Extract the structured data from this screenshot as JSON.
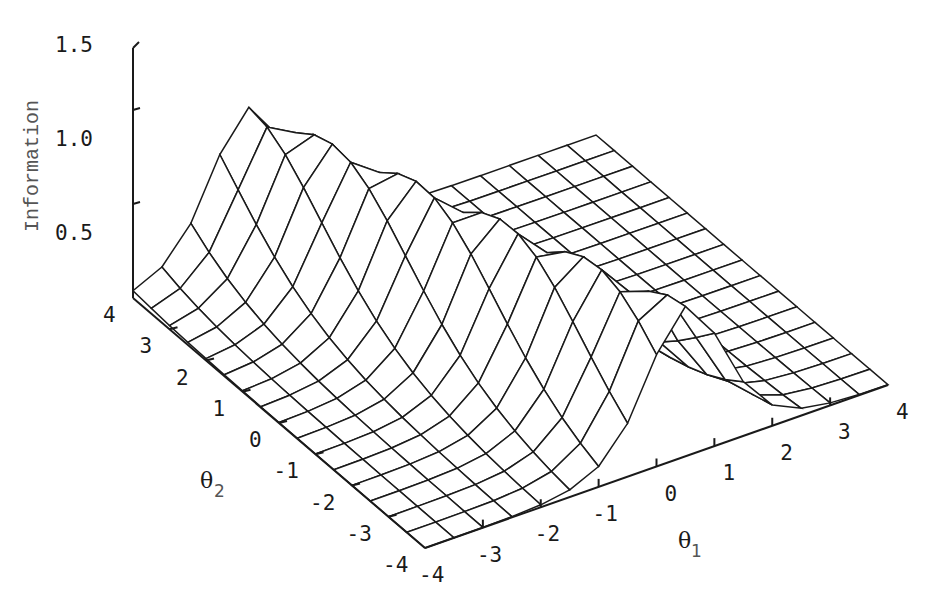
{
  "chart_data": {
    "type": "surface",
    "title": "",
    "zlabel": "Information",
    "xlabel": "θ1",
    "ylabel": "θ2",
    "x_symbol": "θ",
    "x_sub": "1",
    "y_symbol": "θ",
    "y_sub": "2",
    "x_ticks": [
      "-4",
      "-3",
      "-2",
      "-1",
      "0",
      "1",
      "2",
      "3",
      "4"
    ],
    "y_ticks": [
      "-4",
      "-3",
      "-2",
      "-1",
      "0",
      "1",
      "2",
      "3",
      "4"
    ],
    "z_ticks": [
      "0.5",
      "1.0",
      "1.5"
    ],
    "xlim": [
      -4,
      4
    ],
    "ylim": [
      -4,
      4
    ],
    "zlim": [
      0,
      1.5
    ],
    "grid_step": 0.5,
    "surface_model": {
      "description": "Ridge-shaped item information surface, I = a^2 * P * (1 - P), P = 1/(1+exp(-(a1*θ1 + a2*θ2 + d)))",
      "a1": 2.2,
      "a2": 0.69,
      "d": 1.65
    },
    "key_points": [
      {
        "theta1": -4,
        "theta2": 4,
        "information": 0.05
      },
      {
        "theta1": -2,
        "theta2": 4,
        "information": 1.33
      },
      {
        "theta1": 0.5,
        "theta2": -4,
        "information": 1.25
      },
      {
        "theta1": -4,
        "theta2": -4,
        "information": 0.0
      },
      {
        "theta1": 4,
        "theta2": -4,
        "information": 0.03
      },
      {
        "theta1": 4,
        "theta2": 4,
        "information": 0.0
      }
    ],
    "colors": {
      "mesh": "#1a1a1a",
      "background": "#ffffff",
      "zlabel": "#555555"
    }
  }
}
